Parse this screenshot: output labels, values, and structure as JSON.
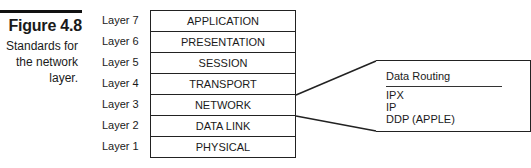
{
  "figure": {
    "label": "Figure 4.8",
    "caption": "Standards for the network layer."
  },
  "layers": [
    {
      "label": "Layer 7",
      "name": "APPLICATION"
    },
    {
      "label": "Layer 6",
      "name": "PRESENTATION"
    },
    {
      "label": "Layer 5",
      "name": "SESSION"
    },
    {
      "label": "Layer 4",
      "name": "TRANSPORT"
    },
    {
      "label": "Layer 3",
      "name": "NETWORK"
    },
    {
      "label": "Layer 2",
      "name": "DATA LINK"
    },
    {
      "label": "Layer 1",
      "name": "PHYSICAL"
    }
  ],
  "callout": {
    "title": "Data Routing",
    "items": [
      "IPX",
      "IP",
      "DDP (APPLE)"
    ],
    "points_to": "NETWORK"
  }
}
